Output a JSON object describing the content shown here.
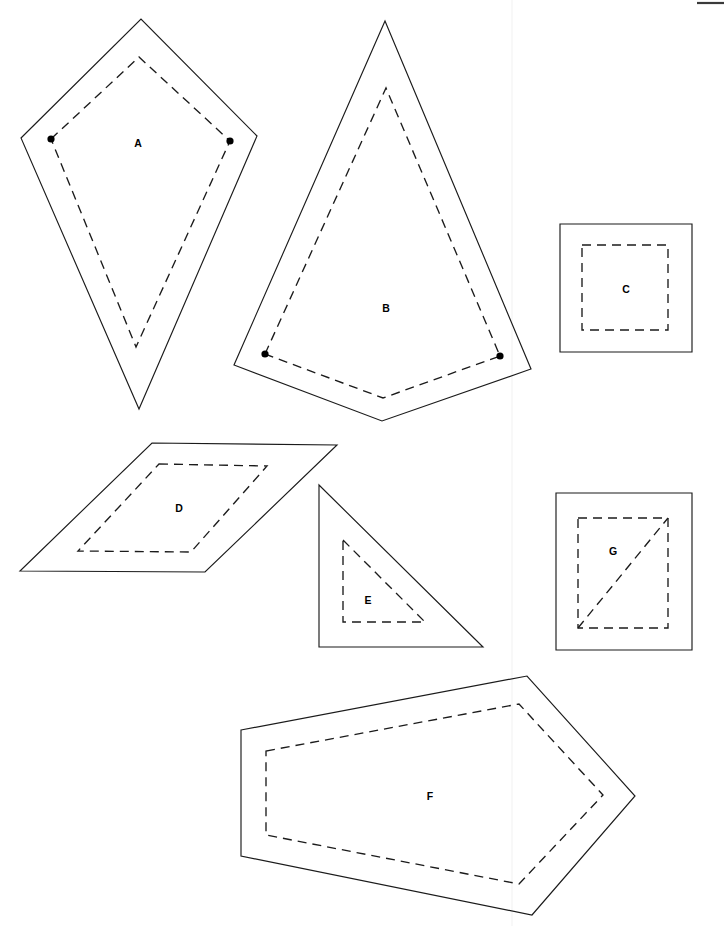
{
  "page": {
    "background_color": "#ffffff",
    "stroke_color": "#1b1b1b",
    "width": 724,
    "height": 926
  },
  "shapes": [
    {
      "id": "A",
      "label": "A",
      "label_pos": [
        138,
        144
      ],
      "kind": "kite",
      "outline": "21,138 141,19 257,136 139,409",
      "inner": "51,139 139,57 230,141 136,347",
      "inner_dashed": true,
      "dots": [
        [
          51,
          139
        ],
        [
          230,
          141
        ]
      ]
    },
    {
      "id": "B",
      "label": "B",
      "label_pos": [
        386,
        309
      ],
      "kind": "pentagon",
      "outline": "385,21 531,369 382,421 234,365",
      "inner": "265,354 386,88 500,356 383,398",
      "inner_dashed": true,
      "dots": [
        [
          265,
          354
        ],
        [
          500,
          356
        ]
      ]
    },
    {
      "id": "C",
      "label": "C",
      "label_pos": [
        626,
        290
      ],
      "kind": "rectangle",
      "outline": "560,224 692,224 692,352 560,352",
      "inner": "582,245 668,245 668,330 582,330",
      "inner_dashed": true,
      "dots": []
    },
    {
      "id": "D",
      "label": "D",
      "label_pos": [
        179,
        509
      ],
      "kind": "parallelogram",
      "outline": "152,443 337,445 205,572 20,571",
      "inner": "159,464 267,466 191,552 78,551",
      "inner_dashed": true,
      "dots": []
    },
    {
      "id": "E",
      "label": "E",
      "label_pos": [
        368,
        601
      ],
      "kind": "right-triangle",
      "outline": "319,485 483,647 319,647",
      "inner": "343,540 425,622 343,622",
      "inner_dashed": true,
      "dots": []
    },
    {
      "id": "F",
      "label": "F",
      "label_pos": [
        430,
        797
      ],
      "kind": "hexagon",
      "outline": "241,730 527,676 635,796 532,915 241,856",
      "inner": "266,751 519,704 603,795 519,884 266,835",
      "inner_dashed": true,
      "dots": []
    },
    {
      "id": "G",
      "label": "G",
      "label_pos": [
        613,
        552
      ],
      "kind": "rectangle-with-diagonal",
      "outline": "556,493 692,493 692,650 556,650",
      "inner": "578,518 668,518 668,628 578,628",
      "inner_dashed": true,
      "diagonal": "578,628 668,518",
      "dots": []
    }
  ],
  "guides": {
    "fold_line": {
      "x": 512,
      "y1": 0,
      "y2": 926,
      "color": "#f2f2f2"
    },
    "edge_mark": {
      "x1": 697,
      "x2": 724,
      "y": 3,
      "color": "#3a3a3a"
    }
  }
}
